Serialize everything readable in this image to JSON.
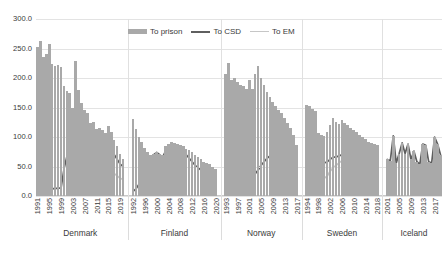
{
  "legend": {
    "position": "top-center",
    "items": [
      {
        "label": "To prison",
        "type": "bar",
        "color": "#a9a9a9"
      },
      {
        "label": "To CSD",
        "type": "line",
        "color": "#5f5f5f"
      },
      {
        "label": "To EM",
        "type": "line",
        "color": "#c6c6c6"
      }
    ]
  },
  "axes": {
    "y_ticks": [
      "0.0",
      "50.0",
      "100.0",
      "150.0",
      "200.0",
      "250.0",
      "300.0"
    ],
    "ylim": [
      0,
      300
    ],
    "grid": true
  },
  "chart_data": {
    "type": "bar",
    "title": "",
    "xlabel": "",
    "ylabel": "",
    "ylim": [
      0,
      300
    ],
    "grid": true,
    "series_names": [
      "To prison",
      "To CSD",
      "To EM"
    ],
    "groups": [
      {
        "name": "Denmark",
        "tick_labels": [
          "1991",
          "1995",
          "1999",
          "2003",
          "2007",
          "2011",
          "2015",
          "2019"
        ],
        "x": [
          1991,
          1992,
          1993,
          1994,
          1995,
          1996,
          1997,
          1998,
          1999,
          2000,
          2001,
          2002,
          2003,
          2004,
          2005,
          2006,
          2007,
          2008,
          2009,
          2010,
          2011,
          2012,
          2013,
          2014,
          2015,
          2016,
          2017,
          2018,
          2019,
          2020
        ],
        "to_prison": [
          252,
          262,
          235,
          240,
          258,
          224,
          220,
          222,
          219,
          186,
          178,
          174,
          150,
          228,
          180,
          158,
          145,
          140,
          124,
          126,
          113,
          116,
          112,
          106,
          118,
          108,
          95,
          84,
          72,
          62
        ],
        "to_csd": [
          10,
          10,
          11,
          11,
          12,
          12,
          13,
          13,
          14,
          46,
          68,
          72,
          75,
          70,
          70,
          68,
          72,
          70,
          68,
          66,
          63,
          62,
          62,
          64,
          66,
          72,
          70,
          62,
          54,
          50
        ],
        "to_em": [
          0,
          0,
          0,
          0,
          0,
          0,
          0,
          0,
          0,
          0,
          0,
          0,
          0,
          0,
          2,
          4,
          7,
          11,
          15,
          20,
          24,
          28,
          32,
          36,
          44,
          40,
          38,
          34,
          30,
          28
        ]
      },
      {
        "name": "Finland",
        "tick_labels": [
          "1992",
          "1996",
          "2000",
          "2004",
          "2008",
          "2012",
          "2016",
          "2020"
        ],
        "x": [
          1992,
          1993,
          1994,
          1995,
          1996,
          1997,
          1998,
          1999,
          2000,
          2001,
          2002,
          2003,
          2004,
          2005,
          2006,
          2007,
          2008,
          2009,
          2010,
          2011,
          2012,
          2013,
          2014,
          2015,
          2016,
          2017,
          2018,
          2019,
          2020
        ],
        "to_prison": [
          131,
          114,
          100,
          92,
          82,
          75,
          70,
          72,
          74,
          72,
          70,
          84,
          88,
          92,
          90,
          88,
          86,
          84,
          80,
          78,
          74,
          70,
          66,
          62,
          58,
          56,
          54,
          50,
          46
        ],
        "to_csd": [
          8,
          12,
          20,
          32,
          44,
          56,
          64,
          70,
          74,
          70,
          66,
          76,
          82,
          84,
          86,
          82,
          78,
          74,
          70,
          64,
          58,
          52,
          48,
          44,
          40,
          36,
          34,
          32,
          30
        ],
        "to_em": [
          0,
          0,
          0,
          0,
          0,
          0,
          0,
          0,
          0,
          0,
          0,
          0,
          0,
          0,
          0,
          0,
          0,
          0,
          0,
          0,
          0,
          0,
          0,
          0,
          0,
          0,
          0,
          0,
          0
        ]
      },
      {
        "name": "Norway",
        "tick_labels": [
          "1993",
          "1997",
          "2001",
          "2005",
          "2009",
          "2013",
          "2017"
        ],
        "x": [
          1993,
          1994,
          1995,
          1996,
          1997,
          1998,
          1999,
          2000,
          2001,
          2002,
          2003,
          2004,
          2005,
          2006,
          2007,
          2008,
          2009,
          2010,
          2011,
          2012,
          2013,
          2014,
          2015,
          2016,
          2017
        ],
        "to_prison": [
          207,
          225,
          196,
          200,
          194,
          188,
          186,
          182,
          196,
          182,
          206,
          220,
          200,
          188,
          176,
          168,
          160,
          152,
          146,
          140,
          132,
          124,
          116,
          104,
          86
        ],
        "to_csd": [
          26,
          26,
          27,
          28,
          27,
          28,
          30,
          32,
          34,
          34,
          38,
          44,
          52,
          58,
          64,
          68,
          72,
          74,
          70,
          66,
          60,
          56,
          52,
          50,
          48
        ],
        "to_em": [
          0,
          0,
          0,
          0,
          0,
          0,
          0,
          0,
          0,
          0,
          0,
          0,
          0,
          0,
          0,
          0,
          0,
          0,
          60,
          66,
          68,
          64,
          60,
          54,
          48
        ]
      },
      {
        "name": "Sweden",
        "tick_labels": [
          "1994",
          "1998",
          "2002",
          "2006",
          "2010",
          "2014",
          "2018"
        ],
        "x": [
          1994,
          1995,
          1996,
          1997,
          1998,
          1999,
          2000,
          2001,
          2002,
          2003,
          2004,
          2005,
          2006,
          2007,
          2008,
          2009,
          2010,
          2011,
          2012,
          2013,
          2014,
          2015,
          2016,
          2017,
          2018
        ],
        "to_prison": [
          155,
          152,
          148,
          144,
          106,
          104,
          102,
          108,
          120,
          132,
          126,
          122,
          128,
          124,
          120,
          116,
          112,
          108,
          104,
          100,
          96,
          92,
          90,
          88,
          86
        ],
        "to_csd": [
          10,
          12,
          16,
          20,
          24,
          30,
          56,
          58,
          62,
          66,
          66,
          68,
          70,
          72,
          74,
          76,
          78,
          76,
          72,
          66,
          60,
          56,
          52,
          50,
          48
        ],
        "to_em": [
          0,
          0,
          0,
          0,
          56,
          28,
          30,
          34,
          42,
          48,
          52,
          56,
          60,
          62,
          60,
          56,
          50,
          44,
          40,
          36,
          32,
          30,
          28,
          26,
          24
        ]
      },
      {
        "name": "Iceland",
        "tick_labels": [
          "2001",
          "2005",
          "2009",
          "2013",
          "2017"
        ],
        "x": [
          2001,
          2002,
          2003,
          2004,
          2005,
          2006,
          2007,
          2008,
          2009,
          2010,
          2011,
          2012,
          2013,
          2014,
          2015,
          2016,
          2017,
          2018,
          2019
        ],
        "to_prison": [
          62,
          60,
          102,
          56,
          72,
          90,
          72,
          88,
          62,
          76,
          58,
          54,
          88,
          86,
          58,
          56,
          100,
          88,
          70
        ],
        "to_csd": [
          62,
          60,
          102,
          56,
          72,
          90,
          72,
          88,
          62,
          76,
          58,
          54,
          88,
          86,
          58,
          56,
          100,
          88,
          70
        ],
        "to_em": [
          0,
          0,
          0,
          0,
          0,
          0,
          0,
          0,
          0,
          0,
          0,
          0,
          20,
          20,
          20,
          20,
          20,
          20,
          20
        ]
      }
    ]
  }
}
